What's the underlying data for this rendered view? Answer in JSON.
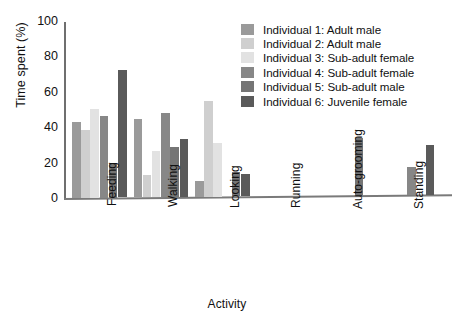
{
  "chart_data": {
    "type": "bar",
    "title": "",
    "xlabel": "Activity",
    "ylabel": "Time spent (%)",
    "ylim": [
      0,
      100
    ],
    "yticks": [
      0,
      20,
      40,
      60,
      80,
      100
    ],
    "grid": false,
    "legend_position": "top-right",
    "categories": [
      "Feeding",
      "Walking",
      "Looking",
      "Running",
      "Auto-grooming",
      "Standing"
    ],
    "series": [
      {
        "name": "Individual 1: Adult male",
        "color": "#9a9a9a",
        "values": [
          43,
          44,
          9,
          0,
          0,
          0
        ]
      },
      {
        "name": "Individual 2: Adult male",
        "color": "#cfcfcf",
        "values": [
          38.5,
          12.5,
          54,
          0,
          0,
          0
        ]
      },
      {
        "name": "Individual 3: Sub-adult female",
        "color": "#e2e2e2",
        "values": [
          50,
          26,
          30.5,
          0,
          0,
          0
        ]
      },
      {
        "name": "Individual 4: Sub-adult female",
        "color": "#878787",
        "values": [
          46,
          47.5,
          0,
          0,
          0,
          15.5
        ]
      },
      {
        "name": "Individual 5: Sub-adult male",
        "color": "#757575",
        "values": [
          19,
          28.5,
          14,
          0,
          32.5,
          0
        ]
      },
      {
        "name": "Individual 6: Juvenile female",
        "color": "#5a5a5a",
        "values": [
          72,
          33,
          12.5,
          0,
          0,
          28
        ]
      }
    ]
  },
  "axes": {
    "y_title": "Time spent (%)",
    "x_title": "Activity",
    "y_ticks": [
      "0",
      "20",
      "40",
      "60",
      "80",
      "100"
    ],
    "x_ticks": [
      "Feeding",
      "Walking",
      "Looking",
      "Running",
      "Auto-grooming",
      "Standing"
    ]
  },
  "legend": {
    "entries": [
      "Individual 1: Adult male",
      "Individual 2: Adult male",
      "Individual 3: Sub-adult female",
      "Individual 4: Sub-adult female",
      "Individual 5: Sub-adult male",
      "Individual 6: Juvenile female"
    ]
  }
}
